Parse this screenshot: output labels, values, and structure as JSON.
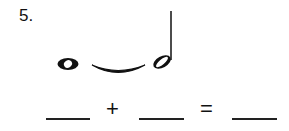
{
  "question": {
    "number": "5.",
    "notes": [
      {
        "type": "whole-note",
        "name": "whole-note-icon"
      },
      {
        "type": "tie",
        "name": "tie-icon"
      },
      {
        "type": "half-note",
        "name": "half-note-icon"
      }
    ],
    "equation": {
      "blank_1": "",
      "plus": "+",
      "blank_2": "",
      "equals": "=",
      "blank_3": ""
    }
  }
}
